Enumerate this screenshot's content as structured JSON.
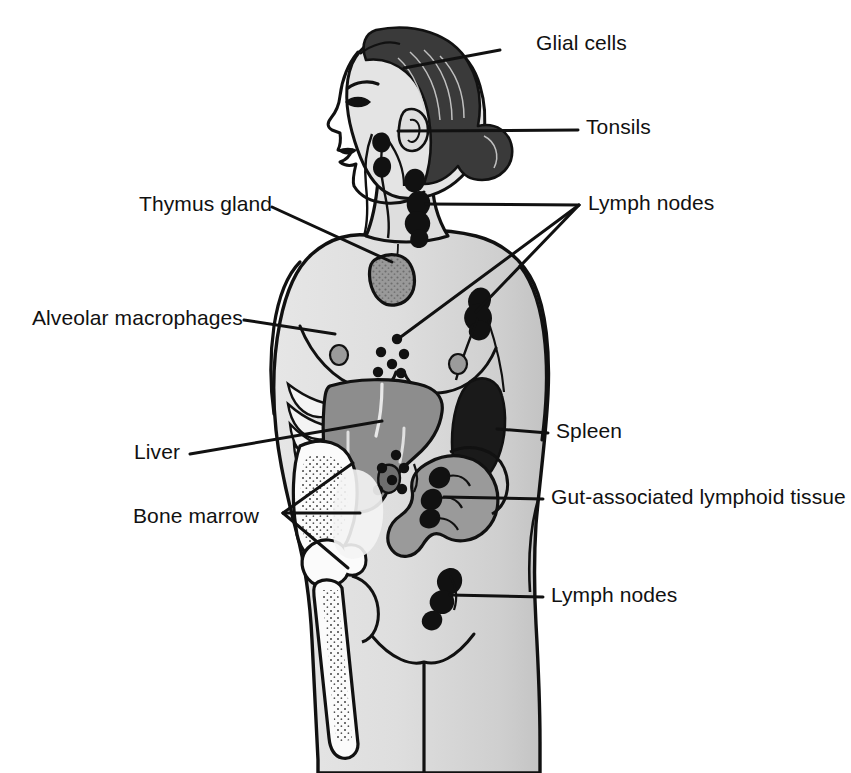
{
  "figure": {
    "background_color": "#ffffff",
    "line_color": "#111111",
    "palette": {
      "body_fill": "#dcdcdc",
      "body_shadow": "#c6c6c6",
      "hair_dark": "#3a3a3a",
      "organ_mid_gray": "#8d8d8d",
      "organ_light_gray": "#a8a8a8",
      "organ_dark": "#1a1a1a",
      "bone_white": "#fbfbfb",
      "outline": "#111111"
    }
  },
  "labels": [
    {
      "id": "glial-cells",
      "text": "Glial cells",
      "text_x": 536,
      "text_y": 43,
      "anchor": "left",
      "leader_lines": [
        {
          "x1": 500,
          "y1": 50,
          "x2": 404,
          "y2": 68
        }
      ]
    },
    {
      "id": "tonsils",
      "text": "Tonsils",
      "text_x": 586,
      "text_y": 127,
      "anchor": "left",
      "leader_lines": [
        {
          "x1": 578,
          "y1": 130,
          "x2": 398,
          "y2": 131
        }
      ]
    },
    {
      "id": "lymph-nodes-upper",
      "text": "Lymph nodes",
      "text_x": 588,
      "text_y": 203,
      "anchor": "left",
      "leader_lines": [
        {
          "x1": 579,
          "y1": 205,
          "x2": 426,
          "y2": 204
        },
        {
          "x1": 579,
          "y1": 205,
          "x2": 398,
          "y2": 339
        },
        {
          "x1": 579,
          "y1": 205,
          "x2": 476,
          "y2": 312
        }
      ]
    },
    {
      "id": "thymus-gland",
      "text": "Thymus gland",
      "text_x": 139,
      "text_y": 204,
      "anchor": "left",
      "leader_lines": [
        {
          "x1": 272,
          "y1": 207,
          "x2": 392,
          "y2": 262
        }
      ]
    },
    {
      "id": "alveolar-macrophages",
      "text": "Alveolar macrophages",
      "text_x": 32,
      "text_y": 318,
      "anchor": "left",
      "leader_lines": [
        {
          "x1": 244,
          "y1": 320,
          "x2": 335,
          "y2": 334
        }
      ]
    },
    {
      "id": "liver",
      "text": "Liver",
      "text_x": 134,
      "text_y": 452,
      "anchor": "left",
      "leader_lines": [
        {
          "x1": 190,
          "y1": 454,
          "x2": 382,
          "y2": 421
        }
      ]
    },
    {
      "id": "bone-marrow",
      "text": "Bone marrow",
      "text_x": 133,
      "text_y": 516,
      "anchor": "left",
      "leader_lines": [
        {
          "x1": 283,
          "y1": 513,
          "x2": 360,
          "y2": 513
        },
        {
          "x1": 283,
          "y1": 513,
          "x2": 353,
          "y2": 463
        },
        {
          "x1": 283,
          "y1": 513,
          "x2": 348,
          "y2": 568
        }
      ]
    },
    {
      "id": "spleen",
      "text": "Spleen",
      "text_x": 556,
      "text_y": 431,
      "anchor": "left",
      "leader_lines": [
        {
          "x1": 548,
          "y1": 433,
          "x2": 497,
          "y2": 429
        }
      ]
    },
    {
      "id": "gut-associated-lymphoid-tissue",
      "text": "Gut-associated lymphoid tissue",
      "text_x": 551,
      "text_y": 497,
      "anchor": "left",
      "leader_lines": [
        {
          "x1": 543,
          "y1": 499,
          "x2": 444,
          "y2": 497
        }
      ]
    },
    {
      "id": "lymph-nodes-lower",
      "text": "Lymph nodes",
      "text_x": 551,
      "text_y": 595,
      "anchor": "left",
      "leader_lines": [
        {
          "x1": 543,
          "y1": 597,
          "x2": 450,
          "y2": 595
        }
      ]
    }
  ],
  "anatomy": {
    "organs": [
      {
        "id": "thymus",
        "name": "Thymus gland",
        "shade": "#8d8d8d"
      },
      {
        "id": "liver",
        "name": "Liver",
        "shade": "#8d8d8d"
      },
      {
        "id": "spleen",
        "name": "Spleen",
        "shade": "#1a1a1a"
      },
      {
        "id": "intestines",
        "name": "Gut-associated lymphoid tissue",
        "shade": "#9a9a9a"
      },
      {
        "id": "pelvis",
        "name": "Pelvis bone",
        "shade": "#fbfbfb"
      },
      {
        "id": "femur",
        "name": "Femur bone",
        "shade": "#fbfbfb"
      },
      {
        "id": "ribs",
        "name": "Rib cage",
        "shade": "#fbfbfb"
      }
    ],
    "lymph_node_clusters": [
      {
        "id": "cervical",
        "name": "Cervical lymph nodes"
      },
      {
        "id": "axillary",
        "name": "Axillary lymph nodes"
      },
      {
        "id": "thoracic",
        "name": "Thoracic lymph nodes"
      },
      {
        "id": "abdominal",
        "name": "Abdominal lymph nodes"
      },
      {
        "id": "inguinal",
        "name": "Inguinal lymph nodes"
      }
    ]
  }
}
